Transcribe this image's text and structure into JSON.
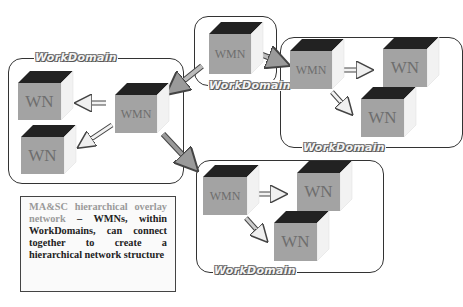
{
  "diagram": {
    "domain_label": "WorkDomain",
    "node_labels": {
      "manager": "WMN",
      "worker": "WN"
    },
    "domains": [
      {
        "id": "top-center",
        "label": "WorkDomain",
        "nodes": [
          "WMN"
        ]
      },
      {
        "id": "left",
        "label": "WorkDomain",
        "nodes": [
          "WMN",
          "WN",
          "WN"
        ]
      },
      {
        "id": "right",
        "label": "WorkDomain",
        "nodes": [
          "WMN",
          "WN",
          "WN"
        ]
      },
      {
        "id": "bottom",
        "label": "WorkDomain",
        "nodes": [
          "WMN",
          "WN",
          "WN"
        ]
      }
    ],
    "cubes": [
      {
        "label": "WMN"
      },
      {
        "label": "WMN"
      },
      {
        "label": "WN"
      },
      {
        "label": "WN"
      },
      {
        "label": "WMN"
      },
      {
        "label": "WN"
      },
      {
        "label": "WN"
      },
      {
        "label": "WMN"
      },
      {
        "label": "WN"
      },
      {
        "label": "WN"
      }
    ],
    "labels": [
      "WorkDomain",
      "WorkDomain",
      "WorkDomain",
      "WorkDomain"
    ],
    "note": {
      "highlight": "MA&SC hierarchical overlay network",
      "dash": " – ",
      "text": "WMNs, within WorkDomains, can connect together to create a hierarchical network structure"
    },
    "colors": {
      "cube_front": "#a3a3a3",
      "cube_top": "#222222",
      "cube_side": "#f2f2f2",
      "label_text": "#6e6e6e",
      "border": "#333333"
    }
  }
}
